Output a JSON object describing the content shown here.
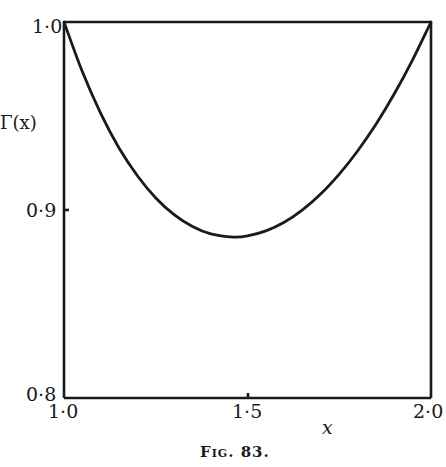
{
  "chart_data": {
    "type": "line",
    "title": "",
    "caption": "Fig. 83.",
    "xlabel": "x",
    "ylabel": "Γ(x)",
    "xlim": [
      1.0,
      2.0
    ],
    "ylim": [
      0.8,
      1.0
    ],
    "grid": false,
    "legend": null,
    "x_ticks": [
      "1·0",
      "1·5",
      "2·0"
    ],
    "y_ticks": [
      "0·8",
      "0·9",
      "1·0"
    ],
    "series": [
      {
        "name": "Γ(x)",
        "x": [
          1.0,
          1.05,
          1.1,
          1.15,
          1.2,
          1.25,
          1.3,
          1.35,
          1.4,
          1.4616,
          1.5,
          1.55,
          1.6,
          1.65,
          1.7,
          1.75,
          1.8,
          1.85,
          1.9,
          1.95,
          2.0
        ],
        "y": [
          1.0,
          0.9735,
          0.9514,
          0.933,
          0.9182,
          0.9064,
          0.8975,
          0.8912,
          0.8873,
          0.8856,
          0.8862,
          0.8889,
          0.8935,
          0.9001,
          0.9086,
          0.9191,
          0.9314,
          0.9456,
          0.9618,
          0.9799,
          1.0
        ]
      }
    ],
    "annotations": [
      "top horizontal line at Γ = 1·0 from x = 1·0 to 2·0"
    ]
  },
  "labels": {
    "ylabel": "Γ(x)",
    "xlabel": "x",
    "caption": "Fig. 83.",
    "y_tick_top": "1·0",
    "y_tick_mid": "0·9",
    "y_tick_bottom": "0·8",
    "x_tick_left": "1·0",
    "x_tick_mid": "1·5",
    "x_tick_right": "2·0"
  }
}
